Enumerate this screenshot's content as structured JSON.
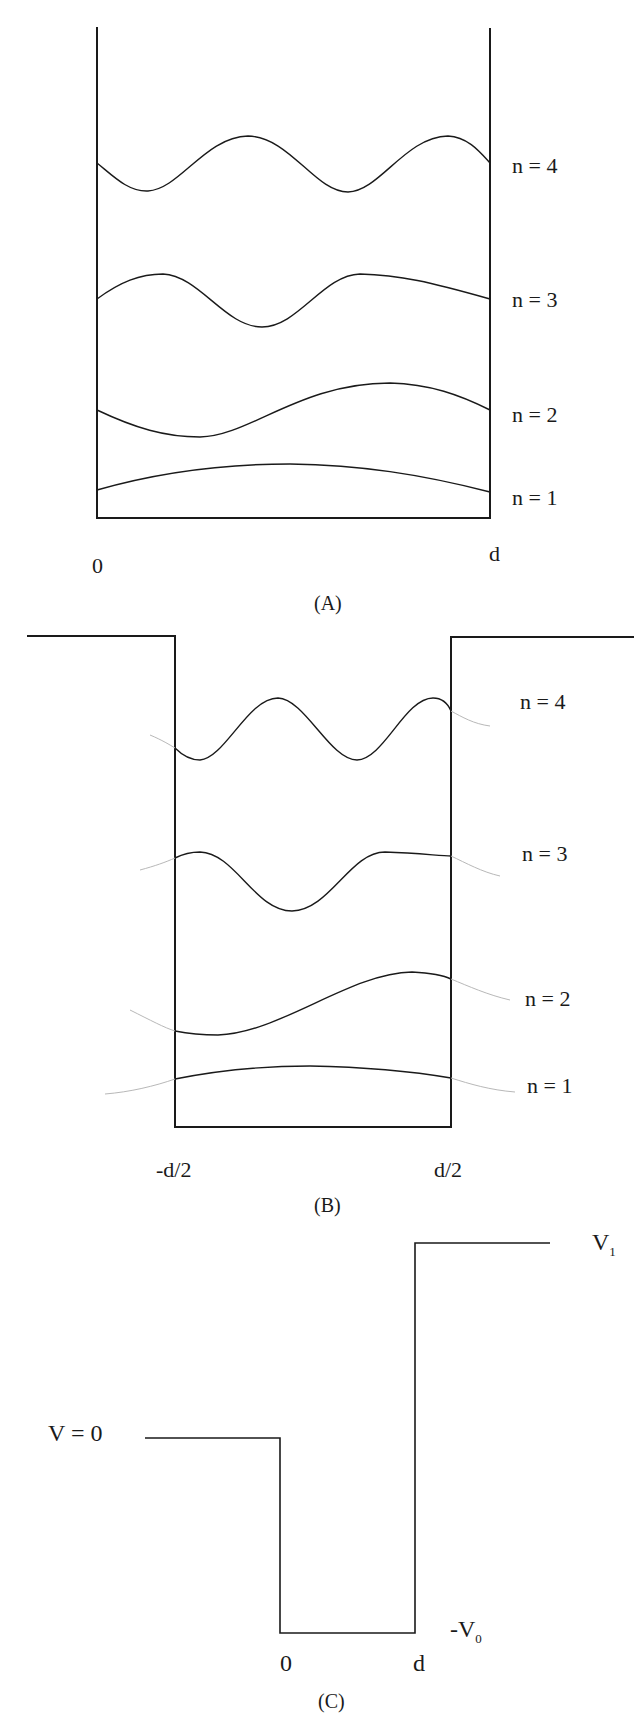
{
  "figure": {
    "panels": [
      {
        "id": "A",
        "caption": "(A)",
        "description": "Infinite square well with wavefunctions",
        "x_labels": {
          "left": "0",
          "right": "d"
        },
        "levels": [
          {
            "n": 4,
            "label": "n = 4"
          },
          {
            "n": 3,
            "label": "n = 3"
          },
          {
            "n": 2,
            "label": "n = 2"
          },
          {
            "n": 1,
            "label": "n = 1"
          }
        ]
      },
      {
        "id": "B",
        "caption": "(B)",
        "description": "Finite square well with wavefunctions leaking into barriers",
        "x_labels": {
          "left": "-d/2",
          "right": "d/2"
        },
        "levels": [
          {
            "n": 4,
            "label": "n = 4"
          },
          {
            "n": 3,
            "label": "n = 3"
          },
          {
            "n": 2,
            "label": "n = 2"
          },
          {
            "n": 1,
            "label": "n = 1"
          }
        ]
      },
      {
        "id": "C",
        "caption": "(C)",
        "description": "Asymmetric step potential well",
        "labels": {
          "v_zero": "V = 0",
          "v_one_main": "V",
          "v_one_sub": "1",
          "v_neg_main": "-V",
          "v_neg_sub": "0",
          "x_left": "0",
          "x_right": "d"
        }
      }
    ],
    "colors": {
      "line": "#1a1a1a",
      "tail": "#b8b8b8",
      "background": "#ffffff"
    }
  }
}
